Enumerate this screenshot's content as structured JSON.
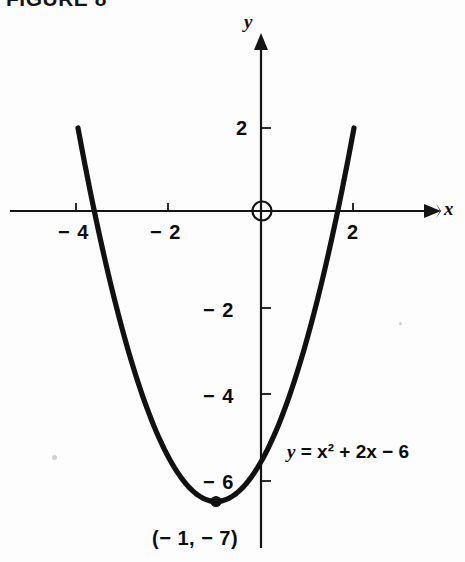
{
  "figure": {
    "title": "FIGURE 8",
    "background_color": "#fdfdfd",
    "ink_color": "#101010"
  },
  "axes": {
    "x_label": "x",
    "y_label": "y",
    "origin_marker": "open-circle",
    "x_ticks": [
      {
        "value": -4,
        "label": "− 4"
      },
      {
        "value": -2,
        "label": "− 2"
      },
      {
        "value": 2,
        "label": "2"
      }
    ],
    "y_ticks": [
      {
        "value": 2,
        "label": "2"
      },
      {
        "value": -2,
        "label": "− 2"
      },
      {
        "value": -4,
        "label": "− 4"
      },
      {
        "value": -6,
        "label": "− 6"
      }
    ]
  },
  "annotations": {
    "equation_prefix": "y",
    "equation_rest": " = x² + 2x − 6",
    "equation_full": "y = x² + 2x − 6",
    "vertex_label": "(− 1, − 7)"
  },
  "chart_data": {
    "type": "line",
    "title": "FIGURE 8",
    "subtitle": "",
    "xlabel": "x",
    "ylabel": "y",
    "grid": false,
    "legend": false,
    "xlim": [
      -5.4,
      3.8
    ],
    "ylim": [
      -7.9,
      3.2
    ],
    "xticks": [
      -4,
      -2,
      2
    ],
    "yticks": [
      2,
      -2,
      -4,
      -6
    ],
    "series": [
      {
        "name": "y = x^2 + 2x - 6",
        "equation": "y = x^2 + 2x - 6",
        "x": [
          -4.0,
          -3.8,
          -3.6,
          -3.4,
          -3.2,
          -3.0,
          -2.8,
          -2.6,
          -2.4,
          -2.2,
          -2.0,
          -1.8,
          -1.6,
          -1.4,
          -1.2,
          -1.0,
          -0.8,
          -0.6,
          -0.4,
          -0.2,
          0.0,
          0.2,
          0.4,
          0.6,
          0.8,
          1.0,
          1.2,
          1.4,
          1.6,
          1.8,
          2.0
        ],
        "y": [
          2.0,
          1.04,
          0.16,
          -0.64,
          -1.36,
          -2.0,
          -2.56,
          -3.04,
          -3.44,
          -3.76,
          -4.0,
          -4.16,
          -4.24,
          -4.24,
          -4.16,
          -4.0,
          -3.76,
          -3.44,
          -3.04,
          -2.56,
          -2.0,
          -1.36,
          -0.64,
          0.16,
          1.04,
          2.0,
          3.04,
          4.16,
          5.36,
          6.64,
          8.0
        ]
      }
    ],
    "points": [
      {
        "name": "vertex",
        "x": -1,
        "y": -7,
        "label": "(-1, -7)",
        "marker": "filled-circle"
      }
    ],
    "annotations": [
      {
        "text": "y = x² + 2x − 6",
        "x": 1.0,
        "y": -5.5
      }
    ]
  }
}
